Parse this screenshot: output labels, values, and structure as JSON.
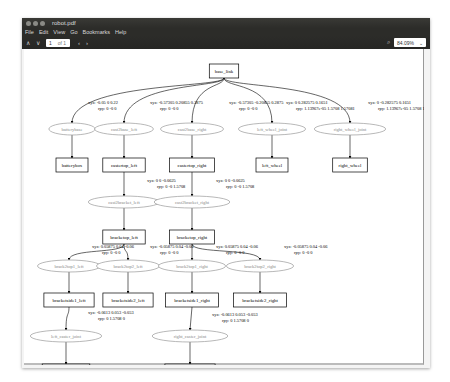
{
  "window": {
    "title": "robot.pdf",
    "menu": [
      "File",
      "Edit",
      "View",
      "Go",
      "Bookmarks",
      "Help"
    ],
    "toolbar": {
      "prev": "∧",
      "next": "∨",
      "page_current": "1",
      "page_of": "of 1",
      "back": "‹",
      "forward": "›",
      "zoom_value": "84.09%",
      "zoom_arrow": "⌄",
      "search_icon": "⌕"
    }
  },
  "graph": {
    "frames": [
      {
        "id": "base_link",
        "label": "base_link",
        "x": 200,
        "y": 22
      },
      {
        "id": "batterybox",
        "label": "batterybox",
        "x": 48,
        "y": 116
      },
      {
        "id": "castertop_left",
        "label": "castertop_left",
        "x": 100,
        "y": 116
      },
      {
        "id": "castertop_right",
        "label": "castertop_right",
        "x": 168,
        "y": 116
      },
      {
        "id": "left_wheel",
        "label": "left_wheel",
        "x": 248,
        "y": 116
      },
      {
        "id": "right_wheel",
        "label": "right_wheel",
        "x": 326,
        "y": 116
      },
      {
        "id": "bracketop_left",
        "label": "bracketop_left",
        "x": 100,
        "y": 188
      },
      {
        "id": "bracketop_right",
        "label": "bracketop_right",
        "x": 168,
        "y": 188
      },
      {
        "id": "bracketside1_left",
        "label": "bracketside1_left",
        "x": 45,
        "y": 251
      },
      {
        "id": "bracketside2_left",
        "label": "bracketside2_left",
        "x": 104,
        "y": 251
      },
      {
        "id": "bracketside1_right",
        "label": "bracketside1_right",
        "x": 168,
        "y": 251
      },
      {
        "id": "bracketside2_right",
        "label": "bracketside2_right",
        "x": 236,
        "y": 251
      },
      {
        "id": "left_casterwheel",
        "label": "left_casterwheel",
        "x": 42,
        "y": 322
      },
      {
        "id": "right_casterwheel",
        "label": "right_casterwheel",
        "x": 166,
        "y": 322
      }
    ],
    "joints": [
      {
        "label": "batterybase",
        "x": 48,
        "y": 80
      },
      {
        "label": "cast2base_left",
        "x": 100,
        "y": 80
      },
      {
        "label": "cast2base_right",
        "x": 168,
        "y": 80
      },
      {
        "label": "left_wheel_joint",
        "x": 248,
        "y": 80
      },
      {
        "label": "right_wheel_joint",
        "x": 326,
        "y": 80
      },
      {
        "label": "cast2bracket_left",
        "x": 100,
        "y": 153
      },
      {
        "label": "cast2bracket_right",
        "x": 168,
        "y": 153
      },
      {
        "label": "brack2top1_left",
        "x": 45,
        "y": 217
      },
      {
        "label": "brack2top2_left",
        "x": 104,
        "y": 217
      },
      {
        "label": "brack2top1_right",
        "x": 168,
        "y": 217
      },
      {
        "label": "brack2top2_right",
        "x": 236,
        "y": 217
      },
      {
        "label": "left_caster_joint",
        "x": 42,
        "y": 287
      },
      {
        "label": "right_caster_joint",
        "x": 166,
        "y": 287
      }
    ],
    "edge_labels": [
      {
        "xyz": "xyz: -0.05 0 0.22",
        "rpy": "rpy: 0 -0 0",
        "x": 64,
        "y": 55
      },
      {
        "xyz": "xyz: -0.57305 0.20855 0.2875",
        "rpy": "rpy: 0 -0 0",
        "x": 126,
        "y": 55
      },
      {
        "xyz": "xyz: -0.57305 -0.20855 0.2875",
        "rpy": "rpy: 0 -0 0",
        "x": 205,
        "y": 55
      },
      {
        "xyz": "xyz: 0 0.282575 0.1651",
        "rpy": "rpy: 1.13967e-05 1.5708 1.57081",
        "x": 262,
        "y": 55
      },
      {
        "xyz": "xyz: 0 -0.282575 0.1651",
        "rpy": "rpy: 1.13967e-05 1.5708 1.57081",
        "x": 344,
        "y": 55
      },
      {
        "xyz": "xyz: 0 0 -0.0625",
        "rpy": "rpy: 0 -0 1.5708",
        "x": 123,
        "y": 133
      },
      {
        "xyz": "xyz: 0 0 -0.0625",
        "rpy": "rpy: 0 -0 1.5708",
        "x": 192,
        "y": 133
      },
      {
        "xyz": "xyz: 0.05875 0.04 -0.06",
        "rpy": "rpy: 0 -0 0",
        "x": 68,
        "y": 199
      },
      {
        "xyz": "xyz: -0.05875 0.04 -0.06",
        "rpy": "rpy: 0 -0 0",
        "x": 126,
        "y": 199
      },
      {
        "xyz": "xyz: 0.05875 0.04 -0.06",
        "rpy": "rpy: 0 -0 0",
        "x": 192,
        "y": 199
      },
      {
        "xyz": "xyz: -0.05875 0.04 -0.06",
        "rpy": "rpy: 0 -0 0",
        "x": 260,
        "y": 199
      },
      {
        "xyz": "xyz: -0.0613 0.053 -0.053",
        "rpy": "rpy: 0 1.5708 0",
        "x": 64,
        "y": 265
      },
      {
        "xyz": "xyz: -0.0613 0.053 -0.053",
        "rpy": "rpy: 0 1.5708 0",
        "x": 188,
        "y": 267
      }
    ]
  }
}
